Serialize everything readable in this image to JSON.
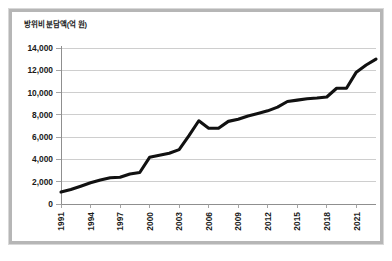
{
  "figure": {
    "axis_title": "방위비 분담액(억 원)",
    "frame_border_color": "#b6b6b6",
    "background_color": "#ffffff",
    "line_color": "#111111",
    "grid_color": "#c9c9c9"
  },
  "chart_data": {
    "type": "line",
    "title": "",
    "subtitle": "",
    "xlabel": "",
    "ylabel": "방위비 분담액(억 원)",
    "ylim": [
      0,
      14000
    ],
    "xlim": [
      1991,
      2023
    ],
    "grid": "horizontal",
    "legend": "none",
    "ytick_labels": [
      "0",
      "2,000",
      "4,000",
      "6,000",
      "8,000",
      "10,000",
      "12,000",
      "14,000"
    ],
    "ytick_values": [
      0,
      2000,
      4000,
      6000,
      8000,
      10000,
      12000,
      14000
    ],
    "xtick_labels": [
      "1991",
      "1994",
      "1997",
      "2000",
      "2003",
      "2006",
      "2009",
      "2012",
      "2015",
      "2018",
      "2021"
    ],
    "xtick_values": [
      1991,
      1994,
      1997,
      2000,
      2003,
      2006,
      2009,
      2012,
      2015,
      2018,
      2021
    ],
    "series": [
      {
        "name": "방위비 분담액",
        "x": [
          1991,
          1992,
          1993,
          1994,
          1995,
          1996,
          1997,
          1998,
          1999,
          2000,
          2001,
          2002,
          2003,
          2004,
          2005,
          2006,
          2007,
          2008,
          2009,
          2010,
          2011,
          2012,
          2013,
          2014,
          2015,
          2016,
          2017,
          2018,
          2019,
          2020,
          2021,
          2022,
          2023
        ],
        "values": [
          1073,
          1300,
          1600,
          1900,
          2150,
          2350,
          2400,
          2700,
          2825,
          4190,
          4368,
          4557,
          4882,
          6132,
          7469,
          6804,
          6800,
          7415,
          7600,
          7904,
          8125,
          8361,
          8695,
          9200,
          9320,
          9441,
          9507,
          9602,
          10389,
          10389,
          11833,
          12472,
          13000
        ]
      }
    ]
  }
}
